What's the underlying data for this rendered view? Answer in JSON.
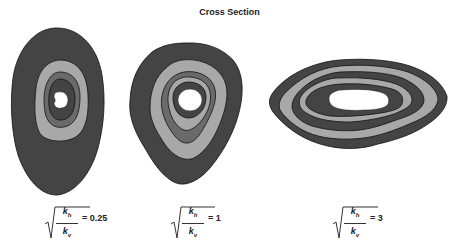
{
  "title": "Cross Section",
  "colors": {
    "dark": "#444444",
    "light": "#a8a8a8",
    "mid": "#6a6a6a",
    "core": "#ffffff",
    "stroke": "#111111"
  },
  "sections": [
    {
      "id": "ratio-0.25",
      "ratio_label": "= 0.25",
      "numerator": "k",
      "numerator_sub": "h",
      "denominator": "k",
      "denominator_sub": "v",
      "shape": "tall-oval",
      "bands_outer_to_inner": [
        "dark",
        "light",
        "mid",
        "dark",
        "core"
      ]
    },
    {
      "id": "ratio-1",
      "ratio_label": "= 1",
      "numerator": "k",
      "numerator_sub": "h",
      "denominator": "k",
      "denominator_sub": "v",
      "shape": "rounded-square",
      "bands_outer_to_inner": [
        "dark",
        "light",
        "mid",
        "light",
        "dark",
        "core"
      ]
    },
    {
      "id": "ratio-3",
      "ratio_label": "= 3",
      "numerator": "k",
      "numerator_sub": "h",
      "denominator": "k",
      "denominator_sub": "v",
      "shape": "wide-oval",
      "bands_outer_to_inner": [
        "dark",
        "light",
        "dark",
        "light",
        "dark",
        "core"
      ]
    }
  ]
}
